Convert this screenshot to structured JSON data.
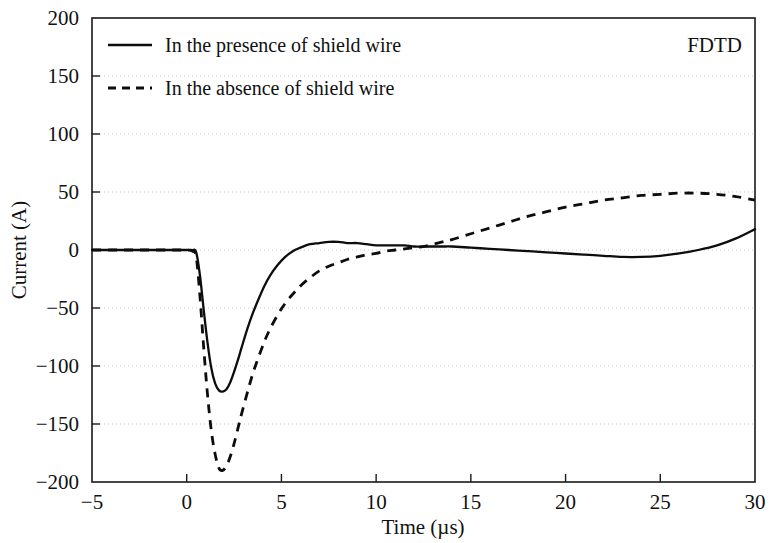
{
  "chart_data": {
    "type": "line",
    "title": "",
    "xlabel": "Time (µs)",
    "ylabel": "Current (A)",
    "xlim": [
      -5,
      30
    ],
    "ylim": [
      -200,
      200
    ],
    "xticks": [
      -5,
      0,
      5,
      10,
      15,
      20,
      25,
      30
    ],
    "yticks": [
      -200,
      -150,
      -100,
      -50,
      0,
      50,
      100,
      150,
      200
    ],
    "xtick_labels": [
      "−5",
      "0",
      "5",
      "10",
      "15",
      "20",
      "25",
      "30"
    ],
    "ytick_labels": [
      "−200",
      "−150",
      "−100",
      "−50",
      "0",
      "50",
      "100",
      "150",
      "200"
    ],
    "grid": true,
    "grid_axis": "y",
    "legend_position": "upper left",
    "annotation": "FDTD",
    "series": [
      {
        "name": "In the presence of shield wire",
        "style": "solid",
        "color": "#0d0d0d",
        "x": [
          -5.0,
          -4.0,
          -3.0,
          -2.0,
          -1.0,
          -0.4,
          0.0,
          0.3,
          0.5,
          0.7,
          0.9,
          1.1,
          1.3,
          1.5,
          1.7,
          1.9,
          2.1,
          2.3,
          2.5,
          2.7,
          2.9,
          3.2,
          3.5,
          3.8,
          4.1,
          4.4,
          4.8,
          5.2,
          5.6,
          6.0,
          6.5,
          7.0,
          7.5,
          8.0,
          8.5,
          9.0,
          9.5,
          10.0,
          10.5,
          11.0,
          11.5,
          12.0,
          12.5,
          13.0,
          13.5,
          14.0,
          15.0,
          16.0,
          17.0,
          18.0,
          19.0,
          20.0,
          21.0,
          22.0,
          23.0,
          24.0,
          25.0,
          26.0,
          27.0,
          28.0,
          29.0,
          30.0
        ],
        "y": [
          0,
          0,
          0,
          0,
          0,
          0,
          0,
          0,
          -2,
          -22,
          -52,
          -80,
          -102,
          -115,
          -121,
          -122,
          -120,
          -114,
          -105,
          -95,
          -84,
          -68,
          -54,
          -42,
          -31,
          -22,
          -13,
          -6,
          -1,
          2,
          5,
          6,
          7,
          7,
          6,
          6,
          5,
          4,
          4,
          4,
          4,
          3,
          3,
          3,
          3,
          3,
          2,
          1,
          0,
          -1,
          -2,
          -3,
          -4,
          -5,
          -6,
          -6,
          -5,
          -3,
          0,
          4,
          10,
          18
        ]
      },
      {
        "name": "In the absence of shield wire",
        "style": "dashed",
        "color": "#0d0d0d",
        "x": [
          -5.0,
          -4.0,
          -3.0,
          -2.0,
          -1.0,
          -0.4,
          0.0,
          0.3,
          0.5,
          0.7,
          0.9,
          1.1,
          1.3,
          1.5,
          1.7,
          1.9,
          2.1,
          2.3,
          2.5,
          2.7,
          2.9,
          3.2,
          3.5,
          3.8,
          4.1,
          4.4,
          4.8,
          5.2,
          5.6,
          6.0,
          6.5,
          7.0,
          7.5,
          8.0,
          8.5,
          9.0,
          9.5,
          10.0,
          10.5,
          11.0,
          11.5,
          12.0,
          12.5,
          13.0,
          13.5,
          14.0,
          15.0,
          16.0,
          17.0,
          18.0,
          19.0,
          20.0,
          21.0,
          22.0,
          23.0,
          24.0,
          25.0,
          26.0,
          27.0,
          28.0,
          29.0,
          30.0
        ],
        "y": [
          0,
          0,
          0,
          0,
          0,
          0,
          0,
          -1,
          -6,
          -40,
          -85,
          -125,
          -156,
          -176,
          -188,
          -190,
          -186,
          -178,
          -167,
          -154,
          -141,
          -123,
          -106,
          -92,
          -79,
          -68,
          -56,
          -46,
          -38,
          -31,
          -24,
          -18,
          -14,
          -11,
          -8,
          -6,
          -4,
          -3,
          -1,
          0,
          1,
          2,
          3,
          5,
          7,
          9,
          14,
          19,
          24,
          29,
          33,
          37,
          40,
          43,
          45,
          47,
          48,
          49,
          49,
          48,
          46,
          43
        ]
      }
    ]
  },
  "legend": {
    "entries": [
      {
        "label": "In the presence of shield wire",
        "style": "solid"
      },
      {
        "label": "In the absence of shield wire",
        "style": "dashed"
      }
    ]
  },
  "annotation": {
    "text": "FDTD"
  }
}
